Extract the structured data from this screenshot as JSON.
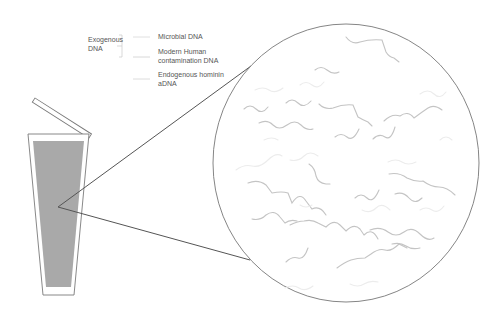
{
  "legend": {
    "group_label_line1": "Exogenous",
    "group_label_line2": "DNA",
    "items": [
      {
        "label_line1": "Microbial DNA",
        "label_line2": "",
        "color": "#c8c8c8"
      },
      {
        "label_line1": "Modern Human",
        "label_line2": "contamination DNA",
        "color": "#ededed"
      },
      {
        "label_line1": "Endogenous hominin",
        "label_line2": "aDNA",
        "color": "#e4e4e4"
      }
    ]
  },
  "colors": {
    "outline": "#7a7a7a",
    "sediment_fill": "#a9a9a9",
    "zoom_lines": "#555555",
    "strand_microbial": "#c4c4c4",
    "strand_faint": "#ececec"
  }
}
